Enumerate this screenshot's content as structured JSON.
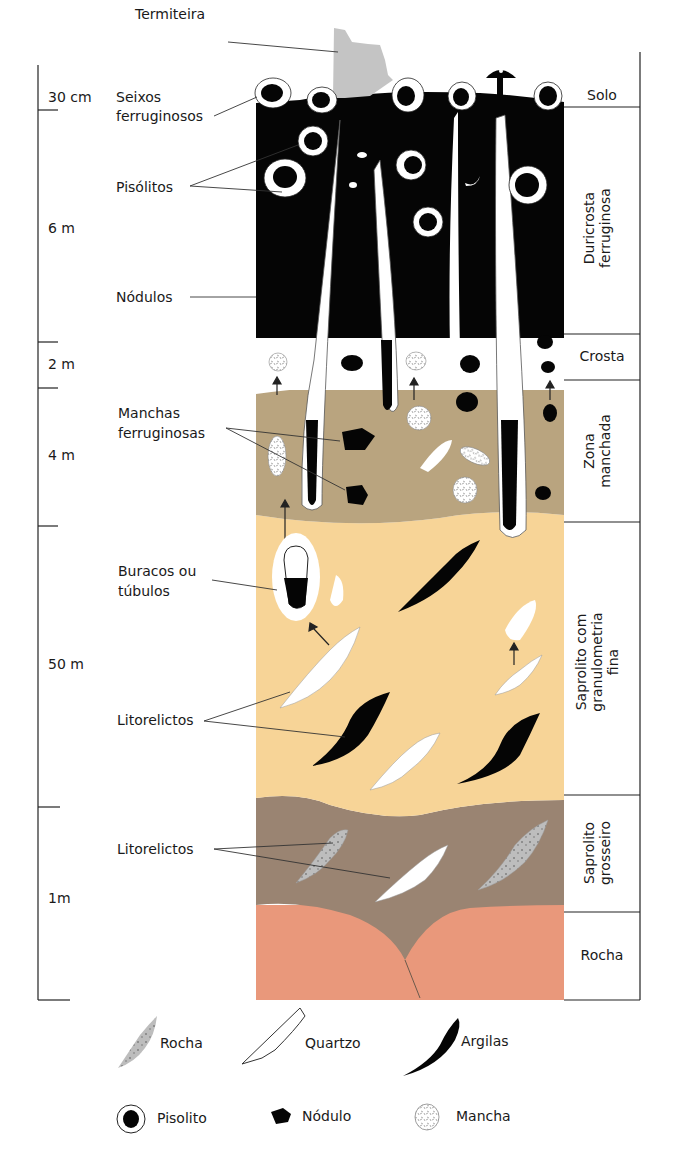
{
  "diagram": {
    "type": "laterite-weathering-profile",
    "callouts": {
      "termiteira": "Termiteira",
      "seixos_1": "Seixos",
      "seixos_2": "ferruginosos",
      "pisolitos": "Pisólitos",
      "nodulos": "Nódulos",
      "manchas_1": "Manchas",
      "manchas_2": "ferruginosas",
      "buracos_1": "Buracos ou",
      "buracos_2": "túbulos",
      "litorelictos_upper": "Litorelictos",
      "litorelictos_lower": "Litorelictos"
    },
    "depth_scale": [
      {
        "label": "30 cm"
      },
      {
        "label": "6 m"
      },
      {
        "label": "2 m"
      },
      {
        "label": "4 m"
      },
      {
        "label": "50 m"
      },
      {
        "label": "1m"
      }
    ],
    "zones": [
      {
        "name": "Solo",
        "lines": [
          "Solo"
        ]
      },
      {
        "name": "Duricrosta ferruginosa",
        "lines": [
          "Duricrosta",
          "ferruginosa"
        ]
      },
      {
        "name": "Crosta",
        "lines": [
          "Crosta"
        ]
      },
      {
        "name": "Zona manchada",
        "lines": [
          "Zona",
          "manchada"
        ]
      },
      {
        "name": "Saprolito com granulometria fina",
        "lines": [
          "Saprolito com",
          "granulometria",
          "fina"
        ]
      },
      {
        "name": "Saprolito grosseiro",
        "lines": [
          "Saprolito",
          "grosseiro"
        ]
      },
      {
        "name": "Rocha",
        "lines": [
          "Rocha"
        ]
      }
    ],
    "colors": {
      "duricrust": "#050505",
      "crust": "#ffffff",
      "mottled": "#b9a47f",
      "fine_saprolite": "#f7d497",
      "coarse_saprolite": "#9a8472",
      "bedrock": "#e9987b",
      "termite_mound": "#c4c4c4",
      "rock_fragment": "#bdbdbd"
    }
  },
  "legend": {
    "items": [
      {
        "icon": "rock-icon",
        "label": "Rocha"
      },
      {
        "icon": "quartz-icon",
        "label": "Quartzo"
      },
      {
        "icon": "clay-icon",
        "label": "Argilas"
      },
      {
        "icon": "pisolite-icon",
        "label": "Pisolito"
      },
      {
        "icon": "nodule-icon",
        "label": "Nódulo"
      },
      {
        "icon": "mottle-icon",
        "label": "Mancha"
      }
    ]
  }
}
